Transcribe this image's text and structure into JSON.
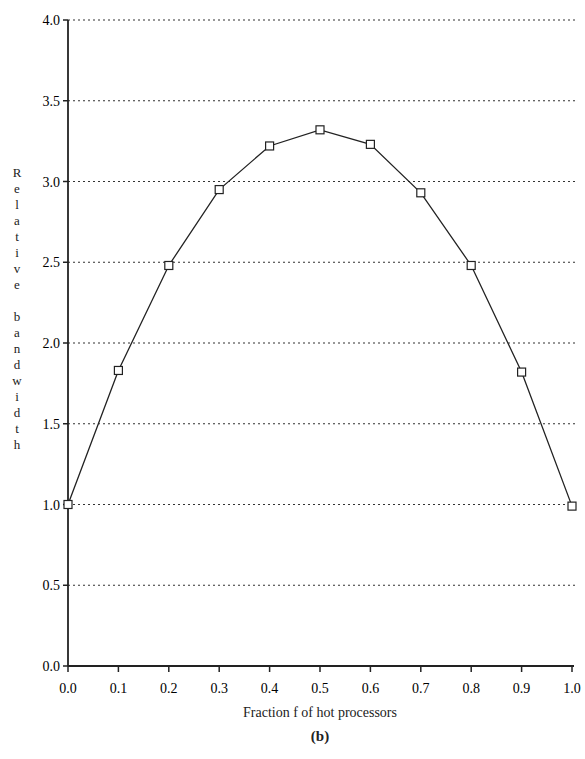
{
  "chart_data": {
    "type": "line",
    "title": "",
    "caption": "(b)",
    "xlabel": "Fraction f of hot processors",
    "ylabel": "Relative bandwidth",
    "x": [
      0.0,
      0.1,
      0.2,
      0.3,
      0.4,
      0.5,
      0.6,
      0.7,
      0.8,
      0.9,
      1.0
    ],
    "series": [
      {
        "name": "relative bandwidth",
        "marker": "square",
        "values": [
          1.0,
          1.83,
          2.48,
          2.95,
          3.22,
          3.32,
          3.23,
          2.93,
          2.48,
          1.82,
          0.99
        ]
      }
    ],
    "xlim": [
      0.0,
      1.0
    ],
    "ylim": [
      0.0,
      4.0
    ],
    "xticks": [
      "0.0",
      "0.1",
      "0.2",
      "0.3",
      "0.4",
      "0.5",
      "0.6",
      "0.7",
      "0.8",
      "0.9",
      "1.0"
    ],
    "yticks": [
      "0.0",
      "0.5",
      "1.0",
      "1.5",
      "2.0",
      "2.5",
      "3.0",
      "3.5",
      "4.0"
    ],
    "grid": "horizontal dotted"
  },
  "labels": {
    "ylabel_vertical": "R\ne\nl\na\nt\ni\nv\ne\n\nb\na\nn\nd\nw\ni\nd\nt\nh",
    "xlabel": "Fraction f of hot processors",
    "caption": "(b)"
  }
}
